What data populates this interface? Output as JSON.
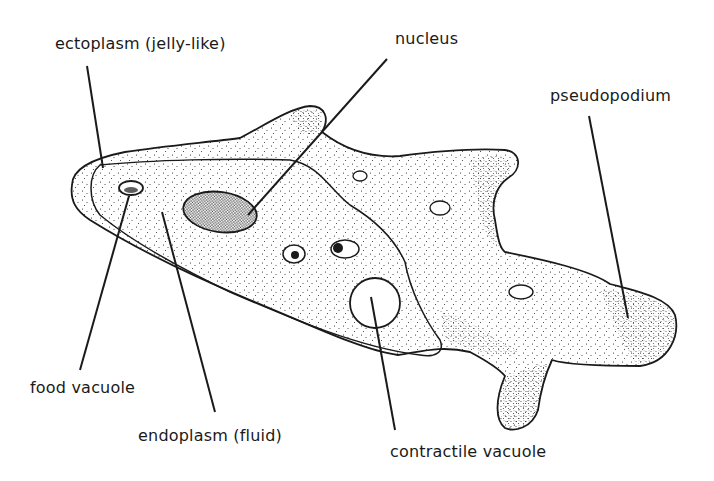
{
  "diagram": {
    "colors": {
      "ink": "#1a1a1a",
      "background": "#ffffff"
    },
    "labels": {
      "ectoplasm": "ectoplasm (jelly-like)",
      "nucleus": "nucleus",
      "pseudopodium": "pseudopodium",
      "food_vacuole": "food vacuole",
      "endoplasm": "endoplasm (fluid)",
      "contractile_vacuole": "contractile vacuole"
    }
  }
}
